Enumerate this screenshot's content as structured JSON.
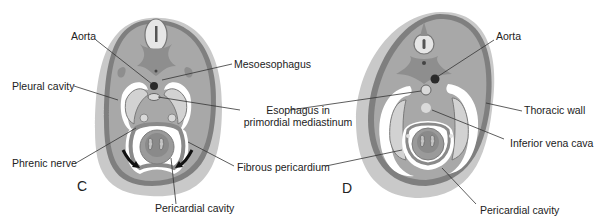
{
  "panels": [
    {
      "id": "C",
      "letter": "C",
      "labels": {
        "aorta": "Aorta",
        "mesoesophagus": "Mesoesophagus",
        "pleural_cavity": "Pleural cavity",
        "esophagus_line1": "Esophagus in",
        "esophagus_line2": "primordial mediastinum",
        "phrenic_nerve": "Phrenic nerve",
        "fibrous_pericardium": "Fibrous pericardium",
        "pericardial_cavity": "Pericardial cavity"
      }
    },
    {
      "id": "D",
      "letter": "D",
      "labels": {
        "aorta": "Aorta",
        "thoracic_wall": "Thoracic wall",
        "inferior_vena_cava": "Inferior vena cava",
        "pericardial_cavity": "Pericardial cavity"
      }
    }
  ],
  "colors": {
    "outer_body": "#c8c8c8",
    "body_wall": "#a9a9a9",
    "dark_tissue": "#8c8c8c",
    "light_cavity": "#d6d6d6",
    "white_space": "#ffffff",
    "aorta": "#2a2a2a",
    "leader_line": "#333333"
  }
}
